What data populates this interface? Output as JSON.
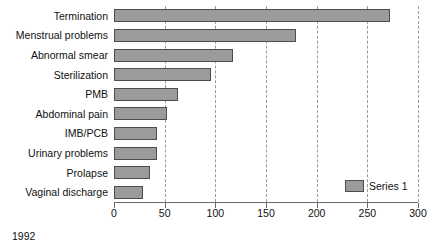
{
  "chart_data": {
    "type": "bar",
    "orientation": "horizontal",
    "title": "",
    "xlabel": "",
    "ylabel": "",
    "xlim": [
      0,
      300
    ],
    "xticks": [
      0,
      50,
      100,
      150,
      200,
      250,
      300
    ],
    "grid": true,
    "grid_axis": "x",
    "grid_style": "dashed",
    "legend": {
      "position": "inside-bottom-right",
      "entries": [
        "Series 1"
      ]
    },
    "categories": [
      "Termination",
      "Menstrual problems",
      "Abnormal smear",
      "Sterilization",
      "PMB",
      "Abdominal pain",
      "IMB/PCB",
      "Urinary problems",
      "Prolapse",
      "Vaginal discharge"
    ],
    "series": [
      {
        "name": "Series 1",
        "values": [
          272,
          180,
          117,
          96,
          63,
          52,
          42,
          42,
          36,
          29
        ]
      }
    ],
    "annotations": [
      "1992"
    ]
  },
  "footnote": "1992",
  "colors": {
    "bar_fill": "#9b9b9b",
    "bar_border": "#4d4d4d",
    "gridline": "#9a9a9a",
    "axis": "#6b6b6b",
    "text": "#111111",
    "background": "#ffffff"
  }
}
